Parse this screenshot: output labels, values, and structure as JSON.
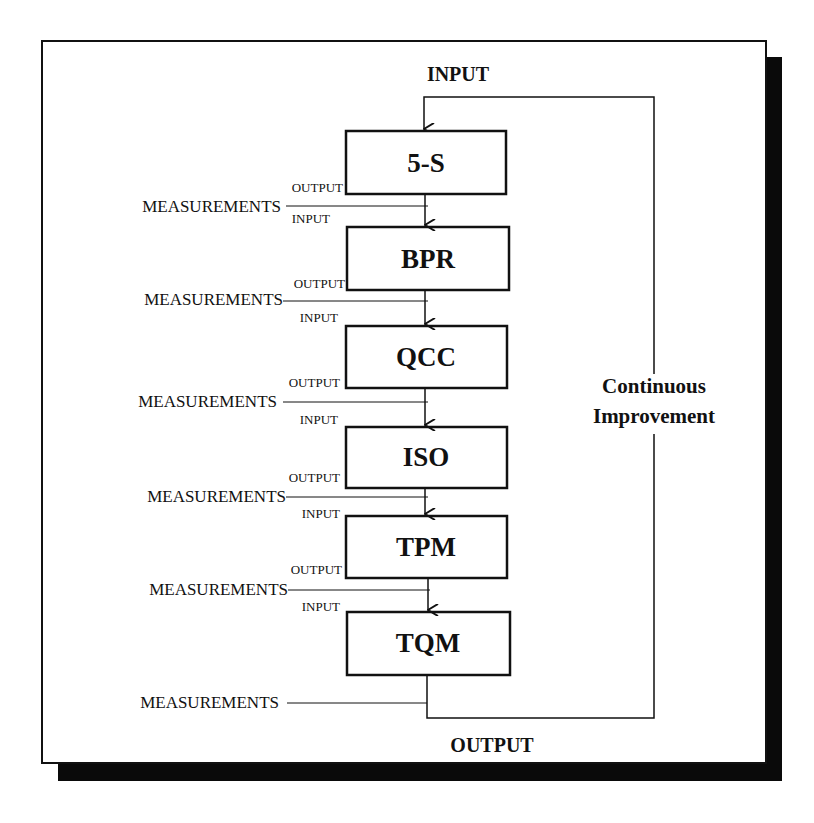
{
  "diagram": {
    "type": "process-flow",
    "top_input_label": "INPUT",
    "bottom_output_label": "OUTPUT",
    "feedback_label_line1": "Continuous",
    "feedback_label_line2": "Improvement",
    "colors": {
      "background": "#ffffff",
      "stroke": "#111111",
      "shadow": "#0a0a0a"
    },
    "stages": [
      {
        "label": "5-S"
      },
      {
        "label": "BPR"
      },
      {
        "label": "QCC"
      },
      {
        "label": "ISO"
      },
      {
        "label": "TPM"
      },
      {
        "label": "TQM"
      }
    ],
    "connectors": [
      {
        "output_label": "OUTPUT",
        "measurements_label": "MEASUREMENTS",
        "input_label": "INPUT"
      },
      {
        "output_label": "OUTPUT",
        "measurements_label": "MEASUREMENTS",
        "input_label": "INPUT"
      },
      {
        "output_label": "OUTPUT",
        "measurements_label": "MEASUREMENTS",
        "input_label": "INPUT"
      },
      {
        "output_label": "OUTPUT",
        "measurements_label": "MEASUREMENTS",
        "input_label": "INPUT"
      },
      {
        "output_label": "OUTPUT",
        "measurements_label": "MEASUREMENTS",
        "input_label": "INPUT"
      }
    ],
    "final_measurements_label": "MEASUREMENTS"
  }
}
